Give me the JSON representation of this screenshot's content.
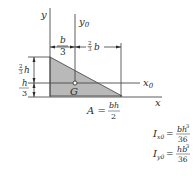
{
  "figure": {
    "shape": "right-triangle",
    "fill_color": "#b9b9b9",
    "line_color": "#3a3a3a",
    "axes": {
      "y_label": "y",
      "y0_label": "y",
      "y0_sub": "0",
      "x_label": "x",
      "x0_label": "x",
      "x0_sub": "0"
    },
    "centroid_label": "G",
    "dimensions": {
      "top_left": {
        "num": "b",
        "den": "3"
      },
      "top_right": {
        "coef_num": "2",
        "coef_den": "3",
        "var": "b"
      },
      "left_upper": {
        "coef_num": "2",
        "coef_den": "3",
        "var": "h"
      },
      "left_lower": {
        "num": "h",
        "den": "3"
      }
    },
    "area": {
      "lhs": "A =",
      "num": "bh",
      "den": "2"
    },
    "moments": [
      {
        "symbol": "I",
        "sub": "x0",
        "num_base": "bh",
        "num_exp": "3",
        "den": "36"
      },
      {
        "symbol": "I",
        "sub": "y0",
        "num_base": "hb",
        "num_exp": "3",
        "den": "36"
      }
    ]
  }
}
